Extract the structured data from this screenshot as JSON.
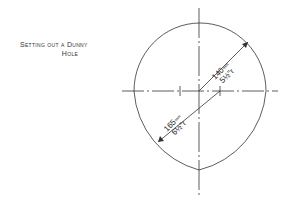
{
  "title": {
    "line1": "Setting out a Dunny",
    "line2": "Hole"
  },
  "dimensions": {
    "upper_radius": {
      "value": "140",
      "unit": "mm",
      "imperial": "5½\"r"
    },
    "lower_radius": {
      "value": "165",
      "unit": "mm",
      "imperial": "6½\"r"
    }
  },
  "colors": {
    "line": "#333333",
    "background": "#ffffff"
  }
}
